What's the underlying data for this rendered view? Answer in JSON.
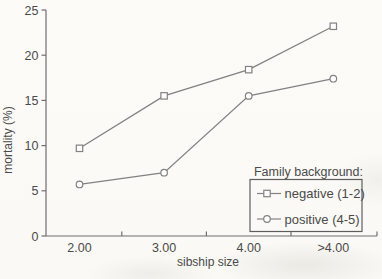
{
  "figure": {
    "background_color": "#fbfaf7",
    "line_color": "#828282",
    "axis_color": "#6e6e6e",
    "text_color": "#4a4a4a",
    "marker_fill": "#ffffff"
  },
  "chart_data": {
    "type": "line",
    "title": "",
    "xlabel": "sibship size",
    "ylabel": "mortality (%)",
    "categories": [
      "2.00",
      "3.00",
      "4.00",
      ">4.00"
    ],
    "series": [
      {
        "name": "negative (1-2)",
        "marker": "square",
        "values": [
          9.7,
          15.5,
          18.4,
          23.2
        ]
      },
      {
        "name": "positive (4-5)",
        "marker": "circle",
        "values": [
          5.7,
          7.0,
          15.5,
          17.4
        ]
      }
    ],
    "ylim": [
      0,
      25
    ],
    "yticks": [
      0,
      5,
      10,
      15,
      20,
      25
    ],
    "grid": false,
    "legend": {
      "title": "Family background:",
      "position": "bottom-right",
      "entries": [
        "negative (1-2)",
        "positive (4-5)"
      ]
    }
  }
}
